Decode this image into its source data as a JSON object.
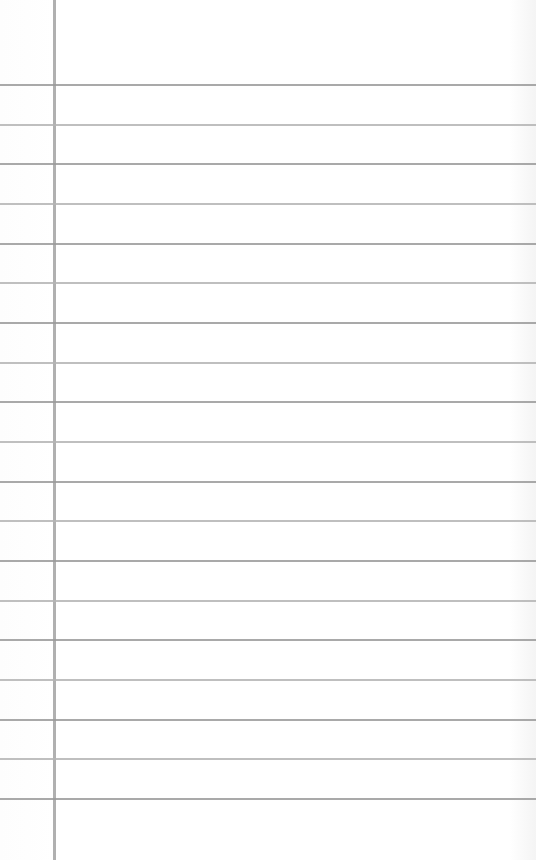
{
  "paper": {
    "type": "lined notebook page",
    "background_color": "#ffffff",
    "rule_color": "#9a9a9a",
    "margin_color": "#b0b0b0",
    "margin_x": 53,
    "first_rule_y": 84,
    "rule_spacing": 39.67,
    "rule_count": 19
  }
}
